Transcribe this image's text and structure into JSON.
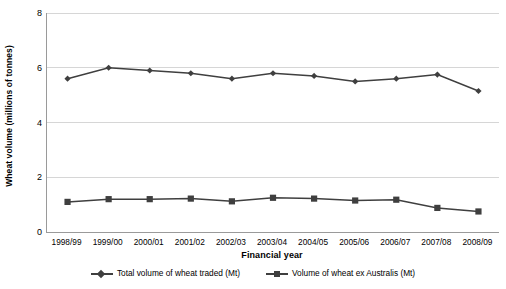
{
  "chart_data": {
    "type": "line",
    "title": "",
    "xlabel": "Financial year",
    "ylabel": "Wheat volume (millions of tonnes)",
    "categories": [
      "1998/99",
      "1999/00",
      "2000/01",
      "2001/02",
      "2002/03",
      "2003/04",
      "2004/05",
      "2005/06",
      "2006/07",
      "2007/08",
      "2008/09"
    ],
    "ylim": [
      0,
      8
    ],
    "yticks": [
      0,
      2,
      4,
      6,
      8
    ],
    "ytick_labels": [
      "0",
      "2",
      "4",
      "6",
      "8"
    ],
    "grid": true,
    "legend_position": "bottom",
    "series": [
      {
        "name": "Total volume of wheat traded (Mt)",
        "marker": "diamond",
        "color": "#3f3f3f",
        "values": [
          5.6,
          6.0,
          5.9,
          5.8,
          5.6,
          5.8,
          5.7,
          5.5,
          5.6,
          5.75,
          5.15
        ]
      },
      {
        "name": "Volume of wheat ex Australis (Mt)",
        "marker": "square",
        "color": "#3f3f3f",
        "values": [
          1.1,
          1.2,
          1.2,
          1.22,
          1.12,
          1.25,
          1.22,
          1.15,
          1.18,
          0.88,
          0.75
        ]
      }
    ]
  },
  "axis": {
    "y_title": "Wheat volume (millions of tonnes)",
    "x_title": "Financial year"
  },
  "legend": {
    "items": [
      {
        "label": "Total volume of wheat traded (Mt)",
        "marker": "diamond-marker"
      },
      {
        "label": "Volume of wheat ex Australis (Mt)",
        "marker": "square-marker"
      }
    ]
  },
  "colors": {
    "series_line": "#3f3f3f",
    "gridline": "#d6d6d6",
    "axis": "#9a9a9a",
    "background": "#ffffff"
  }
}
